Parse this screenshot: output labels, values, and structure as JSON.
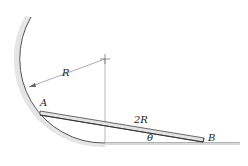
{
  "diagram": {
    "type": "mechanics-figure",
    "labels": {
      "radius": "R",
      "point_a": "A",
      "rod_length": "2R",
      "angle": "θ",
      "point_b": "B"
    },
    "colors": {
      "line": "#555555",
      "rod_fill": "#e6e6e6",
      "rod_edge": "#444444",
      "shade": "#bbbbbb",
      "text": "#222222"
    }
  }
}
